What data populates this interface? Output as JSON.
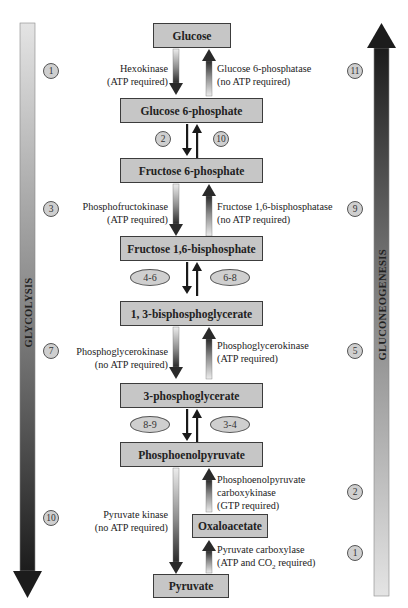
{
  "diagram": {
    "side_labels": {
      "left": "GLYCOLYSIS",
      "right": "GLUCONEOGENESIS"
    },
    "metabolites": [
      {
        "id": "glucose",
        "label": "Glucose"
      },
      {
        "id": "glucose6p",
        "label": "Glucose 6-phosphate"
      },
      {
        "id": "fructose6p",
        "label": "Fructose 6-phosphate"
      },
      {
        "id": "fructose16bp",
        "label": "Fructose 1,6-bisphosphate"
      },
      {
        "id": "bpg13",
        "label": "1, 3-bisphosphoglycerate"
      },
      {
        "id": "pg3",
        "label": "3-phosphoglycerate"
      },
      {
        "id": "pep",
        "label": "Phosphoenolpyruvate"
      },
      {
        "id": "oxaloacetate",
        "label": "Oxaloacetate"
      },
      {
        "id": "pyruvate",
        "label": "Pyruvate"
      }
    ],
    "enzymes": {
      "hexokinase": {
        "name": "Hexokinase",
        "note": "(ATP required)"
      },
      "g6pase": {
        "name": "Glucose 6-phosphatase",
        "note": "(no ATP required)"
      },
      "pfk": {
        "name": "Phosphofructokinase",
        "note": "(ATP required)"
      },
      "fbpase": {
        "name": "Fructose 1,6-bisphosphatase",
        "note": "(no ATP required)"
      },
      "pgk_forward": {
        "name": "Phosphoglycerokinase",
        "note": "(no ATP required)"
      },
      "pgk_reverse": {
        "name": "Phosphoglycerokinase",
        "note": "(ATP required)"
      },
      "pepck": {
        "line1": "Phosphoenolpyruvate",
        "line2": "carboxykinase",
        "note": "(GTP required)"
      },
      "pyruvate_kinase": {
        "name": "Pyruvate kinase",
        "note": "(no ATP required)"
      },
      "pyruvate_carboxylase": {
        "name": "Pyruvate carboxylase",
        "note_prefix": "(ATP and CO",
        "note_sub": "2",
        "note_suffix": " required)"
      }
    },
    "glycolysis_steps": {
      "s1": "1",
      "s2": "2",
      "s3": "3",
      "s4_6": "4-6",
      "s7": "7",
      "s8_9": "8-9",
      "s10": "10"
    },
    "gluconeogenesis_steps": {
      "s1": "1",
      "s2": "2",
      "s3_4": "3-4",
      "s5": "5",
      "s6_8": "6-8",
      "s9": "9",
      "s10": "10",
      "s11": "11"
    },
    "colors": {
      "box_fill": "#c6c6c6",
      "box_border": "#3c3c3c",
      "arrow_dark": "#222222",
      "arrow_light": "#e2e2e2"
    }
  }
}
